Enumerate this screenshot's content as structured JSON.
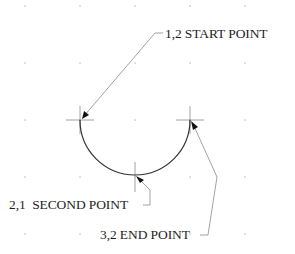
{
  "diagram": {
    "type": "three-point arc construction",
    "background": "#ffffff",
    "line_color": "#333333",
    "leader_color": "#8a8a8a",
    "grid": {
      "x": [
        25,
        80,
        135,
        190,
        245
      ],
      "y": [
        6,
        63,
        120,
        177,
        234
      ],
      "dot_color": "#b5b5b5"
    },
    "arc": {
      "cx": 135,
      "cy": 120,
      "r": 55,
      "from": "start",
      "through": "second",
      "to": "end"
    },
    "points": [
      {
        "id": "start",
        "x": 80,
        "y": 120,
        "coords": "1,2",
        "name": "START POINT"
      },
      {
        "id": "second",
        "x": 135,
        "y": 175,
        "coords": "2,1",
        "name": "SECOND POINT"
      },
      {
        "id": "end",
        "x": 190,
        "y": 120,
        "coords": "3,2",
        "name": "END POINT"
      }
    ],
    "labels": {
      "start": "1,2 START POINT",
      "second": "2,1  SECOND POINT",
      "end": "3,2 END POINT"
    }
  }
}
